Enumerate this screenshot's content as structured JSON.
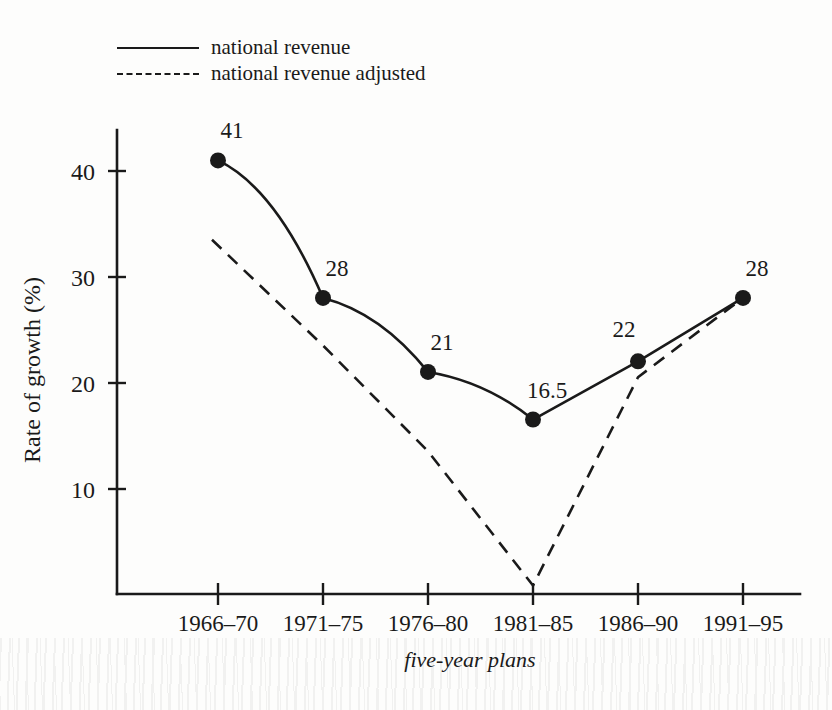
{
  "chart_data": {
    "type": "line",
    "title": "",
    "xlabel": "five-year plans",
    "ylabel": "Rate of growth (%)",
    "categories": [
      "1966–70",
      "1971–75",
      "1976–80",
      "1981–85",
      "1986–90",
      "1991–95"
    ],
    "ylim": [
      0,
      45
    ],
    "yticks": [
      10,
      20,
      30,
      40
    ],
    "ytick_labels": [
      "10",
      "20",
      "30",
      "40"
    ],
    "grid": false,
    "legend_position": "top-left",
    "series": [
      {
        "name": "national revenue",
        "style": "solid",
        "markers": true,
        "values": [
          41,
          28,
          21,
          16.5,
          22,
          28
        ],
        "point_labels": [
          "41",
          "28",
          "21",
          "16.5",
          "22",
          "28"
        ]
      },
      {
        "name": "national revenue adjusted",
        "style": "dashed",
        "markers": false,
        "values": [
          33.5,
          23.5,
          13.5,
          0.8,
          20.5,
          28
        ],
        "point_labels": [
          "",
          "",
          "",
          "",
          "",
          ""
        ]
      }
    ]
  },
  "legend": {
    "items": [
      {
        "label": "national revenue",
        "style": "solid"
      },
      {
        "label": "national revenue adjusted",
        "style": "dashed"
      }
    ]
  },
  "axes": {
    "y_title": "Rate of growth (%)",
    "x_title": "five-year plans",
    "y_ticks": [
      "10",
      "20",
      "30",
      "40"
    ],
    "x_ticks": [
      "1966–70",
      "1971–75",
      "1976–80",
      "1981–85",
      "1986–90",
      "1991–95"
    ]
  },
  "colors": {
    "ink": "#1a1a1a",
    "background": "#fdfdfc"
  }
}
